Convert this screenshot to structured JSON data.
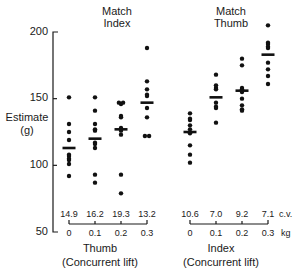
{
  "chart_data": {
    "type": "scatter",
    "title": "",
    "ylabel": "Estimate (g)",
    "ylabel_line1": "Estimate",
    "ylabel_line2": "(g)",
    "ylim": [
      50,
      200
    ],
    "yticks": [
      50,
      100,
      150,
      200
    ],
    "ytick_labels": [
      "50",
      "100",
      "150",
      "200"
    ],
    "grid": false,
    "legend": "none",
    "unit_x": "kg",
    "unit_cv": "c.v.",
    "panels": [
      {
        "title_line1": "Match",
        "title_line2": "Index",
        "xlabel_line1": "Thumb",
        "xlabel_line2": "(Concurrent lift)",
        "categories": [
          "0",
          "0.1",
          "0.2",
          "0.3"
        ],
        "cv": [
          "14.9",
          "16.2",
          "19.3",
          "13.2"
        ],
        "groups": [
          {
            "x": "0",
            "mean": 113,
            "values": [
              151,
              131,
              125,
              119,
              108,
              107,
              105,
              104,
              101,
              92
            ]
          },
          {
            "x": "0.1",
            "mean": 120,
            "values": [
              151,
              141,
              131,
              127,
              126,
              117,
              116,
              113,
              93,
              87
            ]
          },
          {
            "x": "0.2",
            "mean": 127,
            "values": [
              147,
              147,
              146,
              137,
              136,
              128,
              127,
              126,
              123,
              93,
              79
            ]
          },
          {
            "x": "0.3",
            "mean": 147,
            "values": [
              188,
              163,
              157,
              153,
              152,
              143,
              136,
              122,
              122
            ]
          }
        ]
      },
      {
        "title_line1": "Match",
        "title_line2": "Thumb",
        "xlabel_line1": "Index",
        "xlabel_line2": "(Concurrent lift)",
        "categories": [
          "0",
          "0.1",
          "0.2",
          "0.3"
        ],
        "cv": [
          "10.6",
          "7.0",
          "9.2",
          "7.1"
        ],
        "groups": [
          {
            "x": "0",
            "mean": 125,
            "values": [
              139,
              135,
              134,
              130,
              127,
              124,
              115,
              108,
              102
            ]
          },
          {
            "x": "0.1",
            "mean": 151,
            "values": [
              168,
              160,
              158,
              157,
              147,
              144,
              143,
              132
            ]
          },
          {
            "x": "0.2",
            "mean": 156,
            "values": [
              180,
              175,
              158,
              157,
              156,
              155,
              150,
              145,
              142,
              141
            ]
          },
          {
            "x": "0.3",
            "mean": 183,
            "values": [
              205,
              192,
              191,
              189,
              188,
              177,
              172,
              167,
              161
            ]
          }
        ]
      }
    ]
  }
}
